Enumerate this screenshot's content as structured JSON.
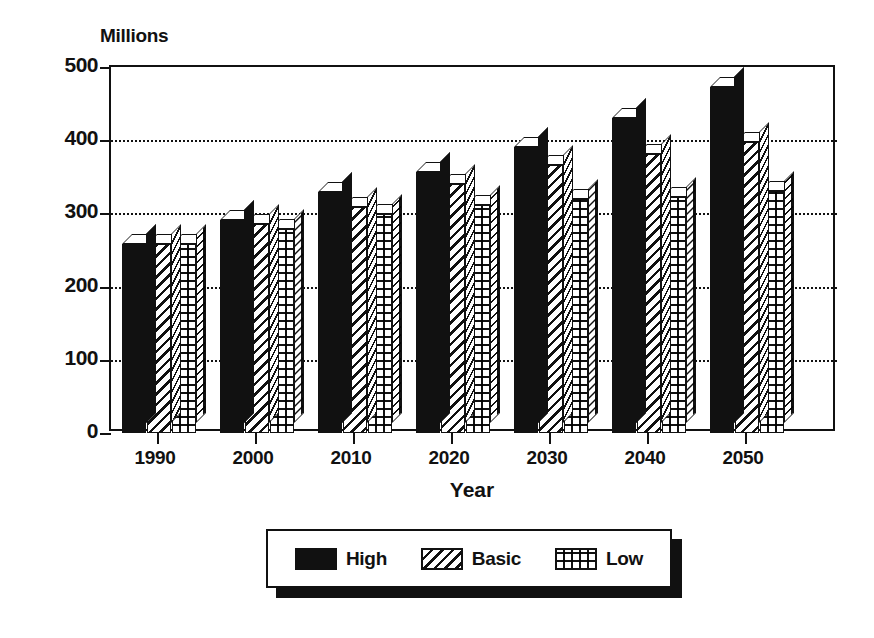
{
  "chart_data": {
    "type": "bar",
    "title": "",
    "unit_label": "Millions",
    "xlabel": "Year",
    "ylabel": "",
    "categories": [
      "1990",
      "2000",
      "2010",
      "2020",
      "2030",
      "2040",
      "2050"
    ],
    "series": [
      {
        "name": "High",
        "pattern": "solid-black",
        "values": [
          258,
          291,
          329,
          357,
          391,
          431,
          473
        ]
      },
      {
        "name": "Basic",
        "pattern": "diagonal-hatch",
        "values": [
          258,
          286,
          309,
          340,
          366,
          381,
          398
        ]
      },
      {
        "name": "Low",
        "pattern": "cross-hatch",
        "values": [
          258,
          279,
          299,
          311,
          320,
          323,
          330
        ]
      }
    ],
    "ylim": [
      0,
      500
    ],
    "yticks": [
      0,
      100,
      200,
      300,
      400,
      500
    ],
    "ytick_labels": [
      "0",
      "100",
      "200",
      "300",
      "400",
      "500"
    ],
    "grid": true,
    "grid_style": "dotted-horizontal",
    "legend_position": "bottom-center",
    "legend_entries": [
      "High",
      "Basic",
      "Low"
    ],
    "style": "3d-bars-monochrome"
  },
  "legend": {
    "items": [
      {
        "label": "High"
      },
      {
        "label": "Basic"
      },
      {
        "label": "Low"
      }
    ]
  },
  "colors": {
    "ink": "#111111",
    "paper": "#ffffff"
  }
}
